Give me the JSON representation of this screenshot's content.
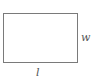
{
  "diagram": {
    "shape": "rectangle",
    "stroke_color": "#7a7a7a",
    "labels": {
      "width": "w",
      "length": "l"
    }
  }
}
